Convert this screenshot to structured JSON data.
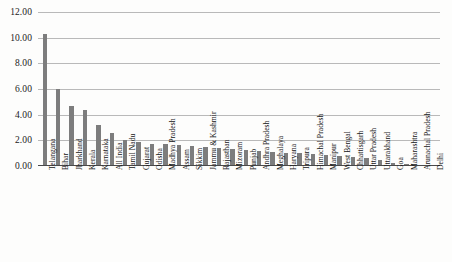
{
  "chart_data": {
    "type": "bar",
    "title": "",
    "xlabel": "",
    "ylabel": "",
    "ylim": [
      0,
      12
    ],
    "grid": true,
    "legend": "none",
    "bar_color": "#7d7d7d",
    "gridline_color": "#b9b9b9",
    "axis_color": "#4a4a4a",
    "y_ticks": [
      "0.00",
      "2.00",
      "4.00",
      "6.00",
      "8.00",
      "10.00",
      "12.00"
    ],
    "y_tick_values": [
      0,
      2,
      4,
      6,
      8,
      10,
      12
    ],
    "categories": [
      "Telangana",
      "Bihar",
      "Jharkhand",
      "Kerala",
      "Karnataka",
      "All India",
      "Tamil Nadu",
      "Gujarat",
      "Odisha",
      "Madhya Pradesh",
      "Assam",
      "Sikkim",
      "Jammu & Kashmir",
      "Rajasthan",
      "Mizoram",
      "Punjab",
      "Andhra Pradesh",
      "Meghalaya",
      "Haryana",
      "Tripura",
      "Himachal Pradesh",
      "Manipur",
      "West Bengal",
      "Chhattisgarh",
      "Uttar Pradesh",
      "Uttarakhand",
      "Goa",
      "Maharashtra",
      "Arunachal Pradesh",
      "Delhi"
    ],
    "values": [
      10.3,
      6.0,
      4.7,
      4.4,
      3.2,
      2.6,
      2.0,
      1.9,
      1.75,
      1.7,
      1.6,
      1.55,
      1.5,
      1.4,
      1.3,
      1.25,
      1.2,
      1.1,
      1.05,
      1.0,
      0.95,
      0.85,
      0.8,
      0.7,
      0.6,
      0.5,
      0.2,
      0.15,
      0.08,
      0.05
    ]
  }
}
